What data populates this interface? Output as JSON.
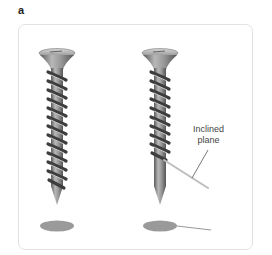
{
  "figure": {
    "panel_label": "a",
    "annotation": {
      "line1": "Inclined",
      "line2": "plane"
    },
    "objects": [
      {
        "name": "screw-left",
        "description": "wood screw"
      },
      {
        "name": "screw-right",
        "description": "wood screw with inclined plane thread highlighted"
      }
    ],
    "colors": {
      "screw": "#8a8a8a",
      "shadow": "#999999",
      "panel_border": "#e2e2e2",
      "text": "#444444"
    }
  }
}
